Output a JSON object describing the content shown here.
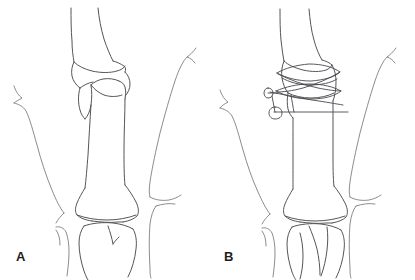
{
  "figure": {
    "type": "medical-line-illustration",
    "background_color": "#ffffff",
    "line_color": "#55555a",
    "width": 415,
    "height": 280,
    "panel_count": 2
  },
  "panels": [
    {
      "id": "a",
      "label": "A",
      "caption_text": "A",
      "description": "Line drawing of a long bone with a displaced oblique metaphyseal fracture at the proximal end, flanked by soft tissue contour lines on each side.",
      "anatomy": {
        "bone_name": "long-bone-shaft",
        "fracture_present": true,
        "fracture_type": "oblique",
        "fracture_location": "proximal-metaphysis",
        "hardware_present": false
      }
    },
    {
      "id": "b",
      "label": "B",
      "caption_text": "B",
      "description": "Line drawing of the same long bone after reduction and internal fixation with crossed cerclage wires and transfixing pins at the proximal fracture site.",
      "anatomy": {
        "bone_name": "long-bone-shaft",
        "fracture_present": true,
        "fracture_type": "oblique-reduced",
        "fracture_location": "proximal-metaphysis",
        "hardware_present": true,
        "hardware_items": [
          "cerclage-wire-upper",
          "cerclage-wire-lower",
          "figure-of-eight-wire",
          "transfixing-pin-upper",
          "transfixing-pin-lower"
        ]
      }
    }
  ]
}
